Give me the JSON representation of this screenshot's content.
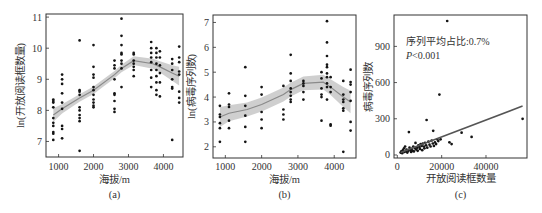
{
  "chart_data": [
    {
      "id": "a",
      "type": "scatter",
      "panel_label": "(a)",
      "title": "",
      "xlabel": "海拔/m",
      "ylabel": "ln(开放阅读框数量)",
      "xlim": [
        640,
        4560
      ],
      "ylim": [
        6.5,
        11.1
      ],
      "xticks": [
        1000,
        2000,
        3000,
        4000
      ],
      "yticks": [
        7,
        8,
        9,
        10,
        11
      ],
      "grid": false,
      "fit": {
        "type": "loess",
        "x": [
          850,
          1100,
          1600,
          2000,
          2600,
          2800,
          3150,
          3700,
          3900,
          4250,
          4450
        ],
        "y": [
          7.85,
          8.05,
          8.4,
          8.65,
          9.15,
          9.35,
          9.6,
          9.5,
          9.4,
          9.2,
          9.1
        ],
        "ci_halfwidth": [
          0.22,
          0.15,
          0.12,
          0.12,
          0.12,
          0.12,
          0.14,
          0.16,
          0.18,
          0.25,
          0.3
        ]
      },
      "points": [
        [
          850,
          8.35
        ],
        [
          850,
          8.3
        ],
        [
          850,
          8.25
        ],
        [
          850,
          8.1
        ],
        [
          850,
          7.75
        ],
        [
          850,
          7.6
        ],
        [
          850,
          7.5
        ],
        [
          850,
          7.3
        ],
        [
          850,
          7.25
        ],
        [
          850,
          7.05
        ],
        [
          1100,
          9.15
        ],
        [
          1100,
          9.0
        ],
        [
          1100,
          8.85
        ],
        [
          1100,
          8.55
        ],
        [
          1100,
          8.25
        ],
        [
          1100,
          8.05
        ],
        [
          1100,
          7.5
        ],
        [
          1100,
          7.4
        ],
        [
          1100,
          7.1
        ],
        [
          1600,
          10.25
        ],
        [
          1600,
          8.65
        ],
        [
          1600,
          8.6
        ],
        [
          1600,
          8.5
        ],
        [
          1600,
          8.1
        ],
        [
          1600,
          8.0
        ],
        [
          1600,
          7.85
        ],
        [
          1600,
          7.75
        ],
        [
          1600,
          7.65
        ],
        [
          1600,
          6.7
        ],
        [
          2000,
          10.1
        ],
        [
          2000,
          9.4
        ],
        [
          2000,
          9.15
        ],
        [
          2000,
          9.05
        ],
        [
          2000,
          8.75
        ],
        [
          2000,
          8.65
        ],
        [
          2000,
          8.5
        ],
        [
          2000,
          8.35
        ],
        [
          2000,
          8.25
        ],
        [
          2000,
          8.15
        ],
        [
          2000,
          8.1
        ],
        [
          2600,
          9.6
        ],
        [
          2600,
          9.45
        ],
        [
          2600,
          9.35
        ],
        [
          2600,
          9.0
        ],
        [
          2600,
          8.55
        ],
        [
          2600,
          8.5
        ],
        [
          2600,
          8.3
        ],
        [
          2600,
          8.05
        ],
        [
          2600,
          7.95
        ],
        [
          2800,
          10.95
        ],
        [
          2800,
          10.4
        ],
        [
          2800,
          10.1
        ],
        [
          2800,
          9.85
        ],
        [
          2800,
          9.8
        ],
        [
          2800,
          9.6
        ],
        [
          2800,
          9.5
        ],
        [
          2800,
          9.35
        ],
        [
          2800,
          8.75
        ],
        [
          3150,
          9.85
        ],
        [
          3150,
          9.8
        ],
        [
          3150,
          9.6
        ],
        [
          3150,
          9.5
        ],
        [
          3150,
          9.4
        ],
        [
          3150,
          9.3
        ],
        [
          3150,
          9.1
        ],
        [
          3650,
          10.2
        ],
        [
          3650,
          10.0
        ],
        [
          3650,
          9.85
        ],
        [
          3650,
          9.7
        ],
        [
          3650,
          9.55
        ],
        [
          3650,
          9.3
        ],
        [
          3650,
          9.05
        ],
        [
          3650,
          8.75
        ],
        [
          3800,
          10.0
        ],
        [
          3800,
          9.85
        ],
        [
          3800,
          9.7
        ],
        [
          3800,
          9.5
        ],
        [
          3800,
          9.3
        ],
        [
          3800,
          9.1
        ],
        [
          3800,
          8.9
        ],
        [
          3800,
          8.65
        ],
        [
          3800,
          8.5
        ],
        [
          3900,
          9.9
        ],
        [
          3900,
          9.7
        ],
        [
          3900,
          9.45
        ],
        [
          3900,
          9.2
        ],
        [
          3900,
          8.9
        ],
        [
          3900,
          8.45
        ],
        [
          4250,
          9.65
        ],
        [
          4250,
          9.5
        ],
        [
          4250,
          9.3
        ],
        [
          4250,
          9.0
        ],
        [
          4250,
          8.75
        ],
        [
          4250,
          8.7
        ],
        [
          4250,
          7.05
        ],
        [
          4450,
          10.05
        ],
        [
          4450,
          9.7
        ],
        [
          4450,
          9.55
        ],
        [
          4450,
          9.25
        ],
        [
          4450,
          9.15
        ],
        [
          4450,
          8.6
        ],
        [
          4450,
          8.4
        ],
        [
          4450,
          8.25
        ]
      ]
    },
    {
      "id": "b",
      "type": "scatter",
      "panel_label": "(b)",
      "title": "",
      "xlabel": "海拔/m",
      "ylabel": "ln(病毒序列数)",
      "xlim": [
        660,
        4600
      ],
      "ylim": [
        1.55,
        7.3
      ],
      "xticks": [
        1000,
        2000,
        3000,
        4000
      ],
      "yticks": [
        2,
        3,
        4,
        5,
        6,
        7
      ],
      "grid": false,
      "fit": {
        "type": "loess",
        "x": [
          850,
          1100,
          1600,
          2000,
          2600,
          2800,
          3150,
          3700,
          3900,
          4250,
          4450
        ],
        "y": [
          3.2,
          3.35,
          3.5,
          3.7,
          4.1,
          4.3,
          4.55,
          4.6,
          4.4,
          4.0,
          3.8
        ],
        "ci_halfwidth": [
          0.4,
          0.32,
          0.28,
          0.28,
          0.28,
          0.28,
          0.28,
          0.3,
          0.32,
          0.4,
          0.45
        ]
      },
      "points": [
        [
          850,
          3.65
        ],
        [
          850,
          3.3
        ],
        [
          850,
          3.2
        ],
        [
          850,
          2.95
        ],
        [
          850,
          2.75
        ],
        [
          850,
          2.2
        ],
        [
          1100,
          4.15
        ],
        [
          1100,
          3.7
        ],
        [
          1100,
          3.6
        ],
        [
          1100,
          3.05
        ],
        [
          1100,
          2.75
        ],
        [
          1550,
          5.2
        ],
        [
          1550,
          4.05
        ],
        [
          1550,
          3.65
        ],
        [
          1550,
          3.25
        ],
        [
          1550,
          2.8
        ],
        [
          1550,
          2.2
        ],
        [
          2000,
          4.4
        ],
        [
          2000,
          4.1
        ],
        [
          2000,
          3.4
        ],
        [
          2000,
          3.1
        ],
        [
          2000,
          2.75
        ],
        [
          2600,
          4.45
        ],
        [
          2600,
          3.5
        ],
        [
          2600,
          3.3
        ],
        [
          2600,
          3.1
        ],
        [
          2800,
          5.7
        ],
        [
          2800,
          4.95
        ],
        [
          2800,
          4.65
        ],
        [
          2800,
          4.35
        ],
        [
          2800,
          4.2
        ],
        [
          2800,
          4.05
        ],
        [
          2800,
          3.9
        ],
        [
          2800,
          3.8
        ],
        [
          3150,
          4.65
        ],
        [
          3150,
          4.55
        ],
        [
          3150,
          4.45
        ],
        [
          3150,
          4.2
        ],
        [
          3150,
          3.9
        ],
        [
          3650,
          5.0
        ],
        [
          3650,
          4.75
        ],
        [
          3650,
          4.35
        ],
        [
          3650,
          4.1
        ],
        [
          3650,
          4.0
        ],
        [
          3650,
          3.05
        ],
        [
          3800,
          7.05
        ],
        [
          3800,
          6.2
        ],
        [
          3800,
          5.65
        ],
        [
          3800,
          5.3
        ],
        [
          3800,
          5.2
        ],
        [
          3800,
          4.95
        ],
        [
          3800,
          4.8
        ],
        [
          3800,
          4.55
        ],
        [
          3800,
          4.4
        ],
        [
          3800,
          3.9
        ],
        [
          3900,
          4.8
        ],
        [
          3900,
          4.4
        ],
        [
          3900,
          4.2
        ],
        [
          3900,
          2.9
        ],
        [
          3900,
          2.85
        ],
        [
          4250,
          4.65
        ],
        [
          4250,
          4.1
        ],
        [
          4250,
          3.9
        ],
        [
          4250,
          3.8
        ],
        [
          4250,
          3.55
        ],
        [
          4250,
          3.45
        ],
        [
          4250,
          1.8
        ],
        [
          4450,
          5.1
        ],
        [
          4450,
          4.6
        ],
        [
          4450,
          4.5
        ],
        [
          4450,
          4.2
        ],
        [
          4450,
          3.85
        ],
        [
          4450,
          3.0
        ],
        [
          4450,
          2.65
        ]
      ]
    },
    {
      "id": "c",
      "type": "scatter",
      "panel_label": "(c)",
      "title": "",
      "xlabel": "开放阅读框数量",
      "ylabel": "病毒序列数",
      "xlim": [
        -1500,
        58500
      ],
      "ylim": [
        -25,
        1160
      ],
      "xticks": [
        0,
        20000,
        40000
      ],
      "yticks": [
        0,
        300,
        600,
        900
      ],
      "grid": false,
      "annotation": {
        "line1": "序列平均占比:0.7%",
        "line2_italic": "P",
        "line2_rest": "<0.001"
      },
      "fit": {
        "type": "linear",
        "x": [
          1500,
          56500
        ],
        "y": [
          20,
          405
        ]
      },
      "points": [
        [
          1500,
          20
        ],
        [
          1800,
          30
        ],
        [
          2200,
          15
        ],
        [
          2500,
          40
        ],
        [
          3000,
          55
        ],
        [
          3200,
          25
        ],
        [
          3500,
          70
        ],
        [
          4000,
          30
        ],
        [
          4200,
          45
        ],
        [
          4500,
          20
        ],
        [
          5000,
          35
        ],
        [
          5200,
          190
        ],
        [
          5500,
          60
        ],
        [
          6000,
          40
        ],
        [
          6200,
          25
        ],
        [
          6500,
          50
        ],
        [
          7000,
          35
        ],
        [
          7200,
          70
        ],
        [
          7500,
          30
        ],
        [
          8000,
          55
        ],
        [
          8200,
          100
        ],
        [
          8500,
          45
        ],
        [
          9000,
          60
        ],
        [
          9200,
          35
        ],
        [
          9500,
          80
        ],
        [
          10000,
          65
        ],
        [
          10200,
          50
        ],
        [
          10500,
          90
        ],
        [
          11000,
          75
        ],
        [
          11200,
          40
        ],
        [
          11500,
          95
        ],
        [
          12000,
          70
        ],
        [
          12200,
          55
        ],
        [
          12500,
          100
        ],
        [
          13000,
          80
        ],
        [
          13200,
          290
        ],
        [
          13500,
          60
        ],
        [
          14000,
          110
        ],
        [
          14500,
          85
        ],
        [
          15000,
          70
        ],
        [
          15500,
          120
        ],
        [
          16000,
          95
        ],
        [
          16200,
          200
        ],
        [
          16500,
          75
        ],
        [
          17000,
          105
        ],
        [
          17500,
          90
        ],
        [
          18000,
          130
        ],
        [
          18500,
          115
        ],
        [
          19000,
          500
        ],
        [
          19500,
          130
        ],
        [
          22500,
          1110
        ],
        [
          23500,
          105
        ],
        [
          24500,
          90
        ],
        [
          29000,
          185
        ],
        [
          33500,
          150
        ],
        [
          56500,
          300
        ]
      ]
    }
  ],
  "colors": {
    "points": "#141414",
    "fit_line": "#8a8a8a",
    "ci_band": "#c7c7c7",
    "fit_line_c": "#555555",
    "frame": "#333333"
  }
}
